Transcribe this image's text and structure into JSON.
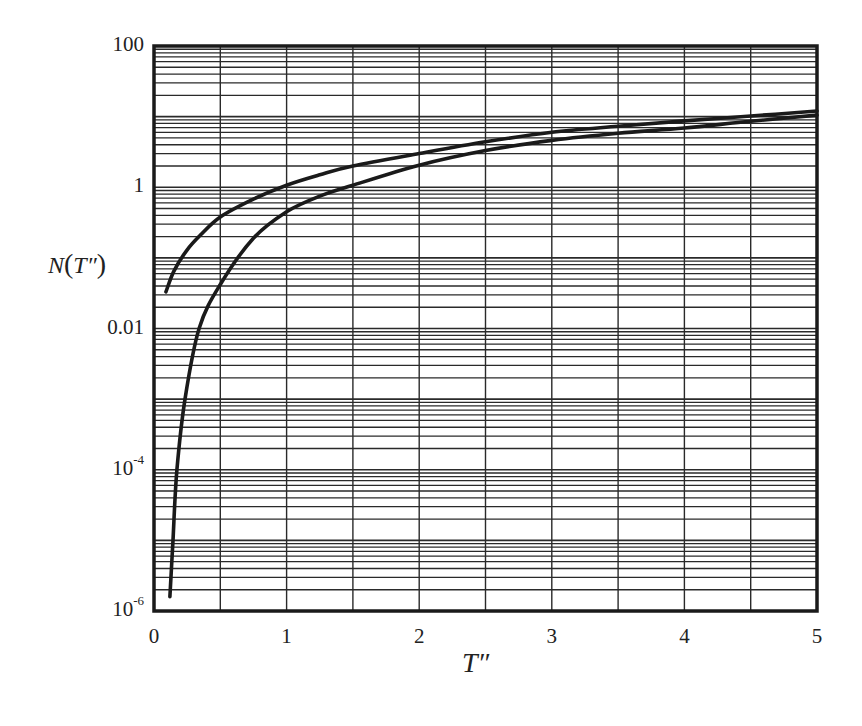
{
  "chart_data": {
    "type": "line",
    "title": "",
    "xlabel": "T″",
    "ylabel": "N(T″)",
    "xscale": "linear",
    "yscale": "log",
    "xlim": [
      0,
      5
    ],
    "ylim": [
      1e-06,
      100
    ],
    "grid": true,
    "legend": null,
    "x_ticks": [
      {
        "value": 0,
        "label": "0"
      },
      {
        "value": 1,
        "label": "1"
      },
      {
        "value": 2,
        "label": "2"
      },
      {
        "value": 3,
        "label": "3"
      },
      {
        "value": 4,
        "label": "4"
      },
      {
        "value": 5,
        "label": "5"
      }
    ],
    "y_ticks": [
      {
        "value": 100,
        "label": "100",
        "base": "100",
        "exp": ""
      },
      {
        "value": 1,
        "label": "1",
        "base": "1",
        "exp": ""
      },
      {
        "value": 0.01,
        "label": "0.01",
        "base": "0.01",
        "exp": ""
      },
      {
        "value": 0.0001,
        "label": "10^-4",
        "base": "10",
        "exp": "-4"
      },
      {
        "value": 1e-06,
        "label": "10^-6",
        "base": "10",
        "exp": "-6"
      }
    ],
    "x_grid_step": 0.5,
    "series": [
      {
        "name": "upper curve",
        "color": "#1a1a1a",
        "points": [
          [
            0.09,
            0.033
          ],
          [
            0.15,
            0.065
          ],
          [
            0.25,
            0.13
          ],
          [
            0.35,
            0.21
          ],
          [
            0.5,
            0.38
          ],
          [
            0.75,
            0.68
          ],
          [
            1.0,
            1.07
          ],
          [
            1.25,
            1.5
          ],
          [
            1.5,
            2.0
          ],
          [
            2.0,
            3.0
          ],
          [
            2.5,
            4.4
          ],
          [
            3.0,
            6.0
          ],
          [
            3.5,
            7.3
          ],
          [
            4.0,
            8.7
          ],
          [
            4.5,
            10.2
          ],
          [
            5.0,
            12.0
          ]
        ]
      },
      {
        "name": "lower curve",
        "color": "#1a1a1a",
        "points": [
          [
            0.12,
            1.6e-06
          ],
          [
            0.143,
            1e-05
          ],
          [
            0.173,
            0.0001
          ],
          [
            0.234,
            0.001
          ],
          [
            0.34,
            0.01
          ],
          [
            0.5,
            0.042
          ],
          [
            0.75,
            0.19
          ],
          [
            1.0,
            0.45
          ],
          [
            1.25,
            0.75
          ],
          [
            1.5,
            1.07
          ],
          [
            2.0,
            2.05
          ],
          [
            2.5,
            3.3
          ],
          [
            3.0,
            4.6
          ],
          [
            3.5,
            5.8
          ],
          [
            4.0,
            6.9
          ],
          [
            4.5,
            8.6
          ],
          [
            5.0,
            10.5
          ]
        ]
      }
    ]
  },
  "axes": {
    "xlabel_text": "T″",
    "ylabel_N": "N",
    "ylabel_open": "(",
    "ylabel_T": "T″",
    "ylabel_close": ")"
  }
}
